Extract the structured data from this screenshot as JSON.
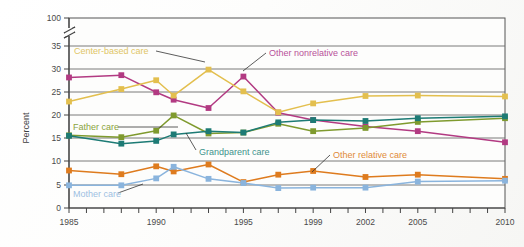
{
  "chart_data": {
    "type": "line",
    "title": "",
    "xlabel": "",
    "ylabel": "Percent",
    "ylim": [
      0,
      35
    ],
    "y_break": {
      "from": 35,
      "to": 100,
      "note": "axis break between 35 and 100"
    },
    "y_ticks": [
      "0",
      "5",
      "10",
      "15",
      "20",
      "25",
      "30",
      "35",
      "100"
    ],
    "grid": true,
    "legend": "inline-labels",
    "x": [
      1985,
      1988,
      1990,
      1991,
      1993,
      1995,
      1997,
      1999,
      2002,
      2005,
      2010
    ],
    "x_tick_labels": [
      "1985",
      "1990",
      "1995",
      "1999",
      "2002",
      "2005",
      "2010"
    ],
    "x_tick_label_years": [
      1985,
      1990,
      1995,
      1999,
      2002,
      2005,
      2010
    ],
    "x_minor_ticks_all_years": true,
    "series": [
      {
        "name": "Other nonrelative care",
        "color": "#b23a82",
        "label_color": "#b8519a",
        "values": [
          28.2,
          28.7,
          25.0,
          23.4,
          21.6,
          28.4,
          20.6,
          19.0,
          17.6,
          16.6,
          14.2
        ]
      },
      {
        "name": "Center-based care",
        "color": "#e3bf4e",
        "label_color": "#e0c566",
        "values": [
          23.0,
          25.7,
          27.6,
          24.3,
          29.9,
          25.2,
          20.7,
          22.6,
          24.2,
          24.3,
          24.1
        ]
      },
      {
        "name": "Father care",
        "color": "#7f9a2e",
        "label_color": "#8aa33c",
        "values": [
          15.7,
          15.3,
          16.7,
          20.0,
          16.1,
          16.3,
          18.2,
          16.6,
          17.3,
          18.6,
          19.4
        ]
      },
      {
        "name": "Grandparent care",
        "color": "#1d7b75",
        "label_color": "#3d938c",
        "values": [
          15.6,
          13.9,
          14.5,
          15.9,
          16.6,
          16.3,
          18.5,
          19.0,
          18.8,
          19.4,
          19.8
        ]
      },
      {
        "name": "Other relative care",
        "color": "#de7b1e",
        "label_color": "#e08a3a",
        "values": [
          8.1,
          7.3,
          9.0,
          7.9,
          9.4,
          5.6,
          7.2,
          8.0,
          6.7,
          7.2,
          6.3
        ]
      },
      {
        "name": "Mother care",
        "color": "#8ab4dd",
        "label_color": "#9dbfe2",
        "values": [
          4.9,
          4.9,
          6.4,
          8.9,
          6.3,
          5.4,
          4.3,
          4.4,
          4.4,
          5.7,
          5.9
        ]
      }
    ],
    "annotations": [
      {
        "text": "Center-based care",
        "series": "Center-based care"
      },
      {
        "text": "Other nonrelative care",
        "series": "Other nonrelative care"
      },
      {
        "text": "Father care",
        "series": "Father care"
      },
      {
        "text": "Grandparent care",
        "series": "Grandparent care"
      },
      {
        "text": "Other relative care",
        "series": "Other relative care"
      },
      {
        "text": "Mother care",
        "series": "Mother care"
      }
    ]
  }
}
